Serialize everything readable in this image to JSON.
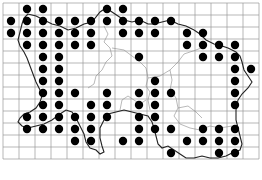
{
  "map": {
    "type": "distribution-grid-map",
    "grid": {
      "columns": 16,
      "rows": 13,
      "origin_x": 3,
      "origin_y": 3,
      "cell_w": 16,
      "cell_h": 12
    },
    "colors": {
      "grid": "#9a9a9a",
      "coast": "#222222",
      "boundary": "#8a8a8a",
      "dot": "#000000",
      "background": "#ffffff"
    },
    "dots": [
      [
        1,
        0
      ],
      [
        2,
        0
      ],
      [
        6,
        0
      ],
      [
        7,
        0
      ],
      [
        0,
        1
      ],
      [
        1,
        1
      ],
      [
        2,
        1
      ],
      [
        3,
        1
      ],
      [
        4,
        1
      ],
      [
        5,
        1
      ],
      [
        6,
        1
      ],
      [
        7,
        1
      ],
      [
        8,
        1
      ],
      [
        9,
        1
      ],
      [
        10,
        1
      ],
      [
        0,
        2
      ],
      [
        1,
        2
      ],
      [
        2,
        2
      ],
      [
        3,
        2
      ],
      [
        4,
        2
      ],
      [
        5,
        2
      ],
      [
        7,
        2
      ],
      [
        8,
        2
      ],
      [
        9,
        2
      ],
      [
        11,
        2
      ],
      [
        12,
        2
      ],
      [
        1,
        3
      ],
      [
        2,
        3
      ],
      [
        3,
        3
      ],
      [
        4,
        3
      ],
      [
        5,
        3
      ],
      [
        11,
        3
      ],
      [
        12,
        3
      ],
      [
        13,
        3
      ],
      [
        14,
        3
      ],
      [
        2,
        4
      ],
      [
        3,
        4
      ],
      [
        8,
        4
      ],
      [
        12,
        4
      ],
      [
        13,
        4
      ],
      [
        14,
        4
      ],
      [
        2,
        5
      ],
      [
        3,
        5
      ],
      [
        14,
        5
      ],
      [
        15,
        5
      ],
      [
        2,
        6
      ],
      [
        3,
        6
      ],
      [
        9,
        6
      ],
      [
        14,
        6
      ],
      [
        2,
        7
      ],
      [
        3,
        7
      ],
      [
        4,
        7
      ],
      [
        6,
        7
      ],
      [
        8,
        7
      ],
      [
        9,
        7
      ],
      [
        10,
        7
      ],
      [
        14,
        7
      ],
      [
        2,
        8
      ],
      [
        3,
        8
      ],
      [
        5,
        8
      ],
      [
        6,
        8
      ],
      [
        8,
        8
      ],
      [
        9,
        8
      ],
      [
        14,
        8
      ],
      [
        1,
        9
      ],
      [
        2,
        9
      ],
      [
        3,
        9
      ],
      [
        4,
        9
      ],
      [
        5,
        9
      ],
      [
        6,
        9
      ],
      [
        8,
        9
      ],
      [
        9,
        9
      ],
      [
        1,
        10
      ],
      [
        2,
        10
      ],
      [
        3,
        10
      ],
      [
        4,
        10
      ],
      [
        5,
        10
      ],
      [
        8,
        10
      ],
      [
        9,
        10
      ],
      [
        10,
        10
      ],
      [
        12,
        10
      ],
      [
        13,
        10
      ],
      [
        14,
        10
      ],
      [
        4,
        11
      ],
      [
        5,
        11
      ],
      [
        7,
        11
      ],
      [
        8,
        11
      ],
      [
        11,
        11
      ],
      [
        12,
        11
      ],
      [
        13,
        11
      ],
      [
        14,
        11
      ],
      [
        10,
        12
      ],
      [
        13,
        12
      ],
      [
        14,
        12
      ]
    ]
  },
  "caption": {
    "text": ""
  }
}
